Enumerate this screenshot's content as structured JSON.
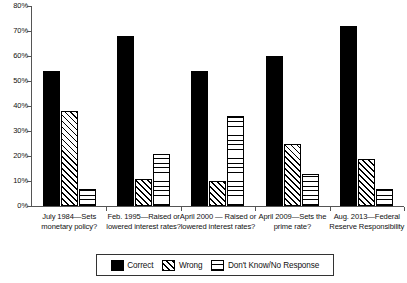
{
  "chart_data": {
    "type": "bar",
    "title": "",
    "subtitle": "",
    "xlabel": "",
    "ylabel": "",
    "ylim": [
      0,
      80
    ],
    "ytick_labels": [
      "0%",
      "10%",
      "20%",
      "30%",
      "40%",
      "50%",
      "60%",
      "70%",
      "80%"
    ],
    "ytick_values": [
      0,
      10,
      20,
      30,
      40,
      50,
      60,
      70,
      80
    ],
    "grid": false,
    "legend_position": "bottom",
    "categories": [
      "July 1984—Sets monetary policy?",
      "Feb. 1995—Raised or lowered interest rates?",
      "April 2000 — Raised or lowered interest rates?",
      "April 2009—Sets the prime rate?",
      "Aug. 2013—Federal Reserve Responsibility"
    ],
    "series": [
      {
        "name": "Correct",
        "pattern": "solid-black",
        "color": "#000000",
        "values": [
          54,
          68,
          54,
          60,
          72
        ]
      },
      {
        "name": "Wrong",
        "pattern": "diagonal-hatch",
        "color": "#000000",
        "values": [
          38,
          11,
          10,
          25,
          19
        ]
      },
      {
        "name": "Don't Know/No Response",
        "pattern": "crosshatch-grid",
        "color": "#000000",
        "values": [
          7,
          21,
          36,
          13,
          7
        ]
      }
    ]
  },
  "legend": {
    "items": [
      {
        "label": "Correct"
      },
      {
        "label": "Wrong"
      },
      {
        "label": "Don't Know/No Response"
      }
    ]
  }
}
